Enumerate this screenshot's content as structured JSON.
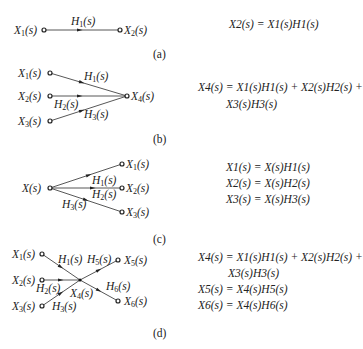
{
  "figure": {
    "panels": [
      {
        "caption": "(a)",
        "nodes": {
          "x1": "X1(s)",
          "x2": "X2(s)"
        },
        "branches": {
          "h1": "H1(s)"
        },
        "equations": [
          "X2(s) = X1(s)H1(s)"
        ]
      },
      {
        "caption": "(b)",
        "nodes": {
          "x1": "X1(s)",
          "x2": "X2(s)",
          "x3": "X3(s)",
          "x4": "X4(s)"
        },
        "branches": {
          "h1": "H1(s)",
          "h2": "H2(s)",
          "h3": "H3(s)"
        },
        "equations": [
          "X4(s) = X1(s)H1(s) + X2(s)H2(s) +",
          "X3(s)H3(s)"
        ]
      },
      {
        "caption": "(c)",
        "nodes": {
          "x": "X(s)",
          "x1": "X1(s)",
          "x2": "X2(s)",
          "x3": "X3(s)"
        },
        "branches": {
          "h1": "H1(s)",
          "h2": "H2(s)",
          "h3": "H3(s)"
        },
        "equations": [
          "X1(s) = X(s)H1(s)",
          "X2(s) = X(s)H2(s)",
          "X3(s) = X(s)H3(s)"
        ]
      },
      {
        "caption": "(d)",
        "nodes": {
          "x1": "X1(s)",
          "x2": "X2(s)",
          "x3": "X3(s)",
          "x4": "X4(s)",
          "x5": "X5(s)",
          "x6": "X6(s)"
        },
        "branches": {
          "h1": "H1(s)",
          "h2": "H2(s)",
          "h3": "H3(s)",
          "h5": "H5(s)",
          "h6": "H6(s)"
        },
        "equations": [
          "X4(s) = X1(s)H1(s) + X2(s)H2(s) +",
          "X3(s)H3(s)",
          "X5(s) = X4(s)H5(s)",
          "X6(s) = X4(s)H6(s)"
        ]
      }
    ]
  }
}
